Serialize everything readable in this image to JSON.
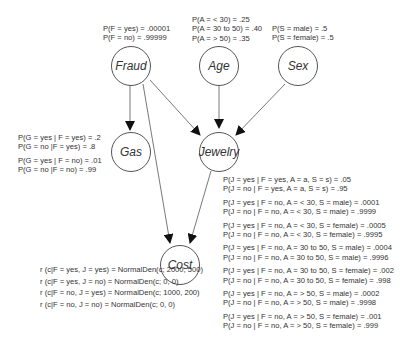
{
  "nodes": {
    "fraud": "Fraud",
    "age": "Age",
    "sex": "Sex",
    "gas": "Gas",
    "jewelry": "Jewelry",
    "cost": "Cost"
  },
  "edges": [
    [
      "Fraud",
      "Gas"
    ],
    [
      "Fraud",
      "Jewelry"
    ],
    [
      "Fraud",
      "Cost"
    ],
    [
      "Age",
      "Jewelry"
    ],
    [
      "Sex",
      "Jewelry"
    ],
    [
      "Jewelry",
      "Cost"
    ]
  ],
  "cpts": {
    "fraud": [
      "P(F = yes) = .00001",
      "P(F = no) = .99999"
    ],
    "age": [
      "P(A = < 30) = .25",
      "P(A = 30 to 50) = .40",
      "P(A = > 50) = .35"
    ],
    "sex": [
      "P(S = male) = .5",
      "P(S = female) = .5"
    ],
    "gas": [
      "P(G = yes | F = yes) = .2",
      "P(G = no |F = yes) = .8",
      "P(G = yes | F = no) = .01",
      "P(G = no |F = no) = .99"
    ],
    "jewelry": [
      "P(J = yes | F = yes, A = a, S = s) = .05",
      "P(J = no | F = yes, A = a, S = s) = .95",
      "P(J = yes | F = no, A = < 30, S = male) = .0001",
      "P(J = no | F = no, A = < 30, S = male) = .9999",
      "P(J = yes | F = no, A = < 30, S = female) = .0005",
      "P(J = no | F = no, A = < 30, S = female) = .9995",
      "P(J = yes | F = no, A = 30 to 50, S = male) = .0004",
      "P(J = no | F = no, A = 30 to 50, S = male) = .9996",
      "P(J = yes | F = no, A = 30 to 50, S = female) = .002",
      "P(J = no | F = no, A = 30 to 50, S = female) = .998",
      "P(J = yes | F = no, A = > 50, S = male) = .0002",
      "P(J = no | F = no, A = > 50, S = male) = .9998",
      "P(J = yes | F = no, A = > 50, S = female) = .001",
      "P(J = no | F = no, A = > 50, S = female) = .999"
    ],
    "cost": [
      "r (c|F = yes, J = yes) = NormalDen(c; 2000, 500)",
      "r (c|F = yes, J = no) = NormalDen(c; 0, 0)",
      "r (c|F = no, J = yes) = NormalDen(c; 1000, 200)",
      "r (c|F = no, J = no) = NormalDen(c; 0, 0)"
    ]
  }
}
